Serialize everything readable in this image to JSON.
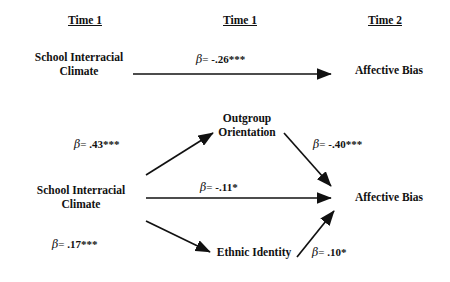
{
  "figure": {
    "type": "path-diagram",
    "title": "",
    "background_color": "#ffffff",
    "line_color": "#111111"
  },
  "columns": [
    {
      "id": "col-time1-left",
      "label": "Time 1"
    },
    {
      "id": "col-time1-mid",
      "label": "Time 1"
    },
    {
      "id": "col-time2-right",
      "label": "Time 2"
    }
  ],
  "models": [
    {
      "id": "total-effect-model",
      "nodes": [
        {
          "id": "sic-top",
          "line1": "School Interracial",
          "line2": "Climate"
        },
        {
          "id": "ab-top",
          "line1": "Affective Bias",
          "line2": ""
        }
      ],
      "paths": [
        {
          "id": "sic-to-ab-total",
          "from": "sic-top",
          "to": "ab-top",
          "beta": "β",
          "equals": "= ",
          "value": "-.26",
          "stars": "***",
          "label": "β= -.26***"
        }
      ]
    },
    {
      "id": "mediation-model",
      "nodes": [
        {
          "id": "sic-mid",
          "line1": "School Interracial",
          "line2": "Climate"
        },
        {
          "id": "outgroup",
          "line1": "Outgroup",
          "line2": "Orientation"
        },
        {
          "id": "ethnic",
          "line1": "Ethnic Identity",
          "line2": ""
        },
        {
          "id": "ab-mid",
          "line1": "Affective Bias",
          "line2": ""
        }
      ],
      "paths": [
        {
          "id": "sic-to-outgroup",
          "from": "sic-mid",
          "to": "outgroup",
          "beta": "β",
          "equals": "= ",
          "value": ".43",
          "stars": "***",
          "label": "β= .43***"
        },
        {
          "id": "outgroup-to-ab",
          "from": "outgroup",
          "to": "ab-mid",
          "beta": "β",
          "equals": "= ",
          "value": "-.40",
          "stars": "***",
          "label": "β= -.40***"
        },
        {
          "id": "sic-to-ab-direct",
          "from": "sic-mid",
          "to": "ab-mid",
          "beta": "β",
          "equals": "= ",
          "value": "-.11",
          "stars": "*",
          "label": "β= -.11*"
        },
        {
          "id": "sic-to-ethnic",
          "from": "sic-mid",
          "to": "ethnic",
          "beta": "β",
          "equals": "= ",
          "value": ".17",
          "stars": "***",
          "label": "β= .17***"
        },
        {
          "id": "ethnic-to-ab",
          "from": "ethnic",
          "to": "ab-mid",
          "beta": "β",
          "equals": "= ",
          "value": ".10",
          "stars": "*",
          "label": "β= .10*"
        }
      ]
    }
  ]
}
